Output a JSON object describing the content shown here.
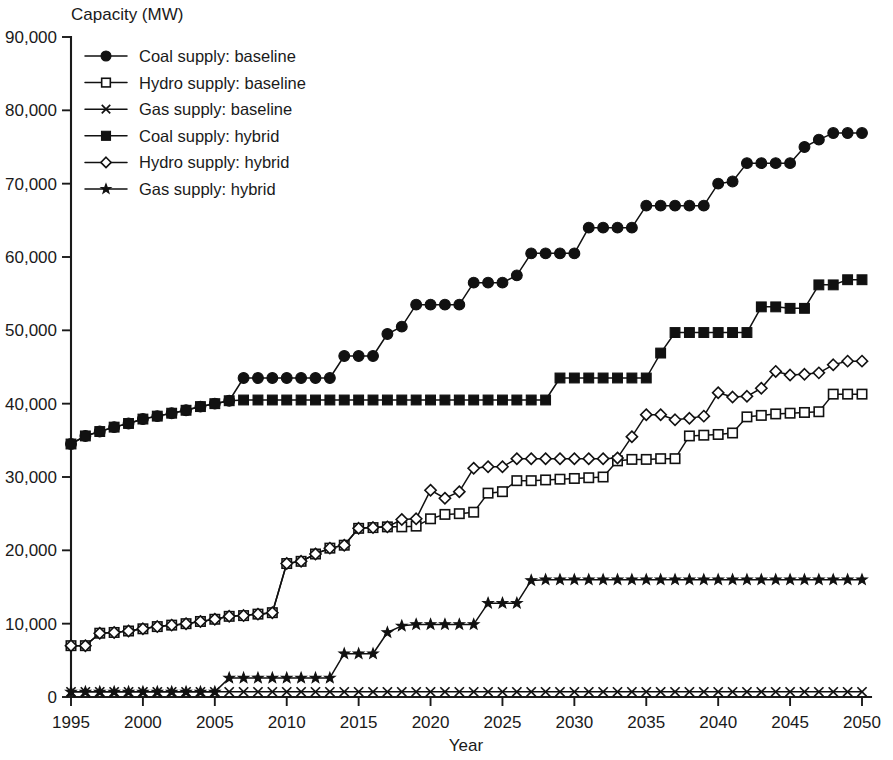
{
  "chart_data": {
    "type": "line",
    "title": "",
    "ylabel": "Capacity (MW)",
    "xlabel": "Year",
    "xlim": [
      1995,
      2050
    ],
    "ylim": [
      0,
      90000
    ],
    "ytick_labels": [
      "0",
      "10,000",
      "20,000",
      "30,000",
      "40,000",
      "50,000",
      "60,000",
      "70,000",
      "80,000",
      "90,000"
    ],
    "ytick_values": [
      0,
      10000,
      20000,
      30000,
      40000,
      50000,
      60000,
      70000,
      80000,
      90000
    ],
    "xtick_labels": [
      "1995",
      "2000",
      "2005",
      "2010",
      "2015",
      "2020",
      "2025",
      "2030",
      "2035",
      "2040",
      "2045",
      "2050"
    ],
    "xtick_values": [
      1995,
      2000,
      2005,
      2010,
      2015,
      2020,
      2025,
      2030,
      2035,
      2040,
      2045,
      2050
    ],
    "grid": false,
    "legend_position": "top-left",
    "x": [
      1995,
      1996,
      1997,
      1998,
      1999,
      2000,
      2001,
      2002,
      2003,
      2004,
      2005,
      2006,
      2007,
      2008,
      2009,
      2010,
      2011,
      2012,
      2013,
      2014,
      2015,
      2016,
      2017,
      2018,
      2019,
      2020,
      2021,
      2022,
      2023,
      2024,
      2025,
      2026,
      2027,
      2028,
      2029,
      2030,
      2031,
      2032,
      2033,
      2034,
      2035,
      2036,
      2037,
      2038,
      2039,
      2040,
      2041,
      2042,
      2043,
      2044,
      2045,
      2046,
      2047,
      2048,
      2049,
      2050
    ],
    "series": [
      {
        "name": "Coal supply: baseline",
        "marker": "filled-circle",
        "values": [
          34500,
          35600,
          36200,
          36800,
          37300,
          37900,
          38300,
          38700,
          39100,
          39600,
          40000,
          40400,
          43500,
          43500,
          43500,
          43500,
          43500,
          43500,
          43500,
          46500,
          46500,
          46500,
          49500,
          50500,
          53500,
          53500,
          53500,
          53500,
          56500,
          56500,
          56500,
          57500,
          60500,
          60500,
          60500,
          60500,
          64000,
          64000,
          64000,
          64000,
          67000,
          67000,
          67000,
          67000,
          67000,
          70000,
          70300,
          72800,
          72800,
          72800,
          72800,
          75000,
          76000,
          76900,
          76900,
          76900
        ]
      },
      {
        "name": "Hydro supply: baseline",
        "marker": "open-square",
        "values": [
          7000,
          7000,
          8700,
          8800,
          9000,
          9300,
          9600,
          9800,
          10000,
          10300,
          10600,
          11000,
          11100,
          11300,
          11500,
          18200,
          18500,
          19500,
          20300,
          20700,
          23000,
          23100,
          23200,
          23200,
          23300,
          24300,
          24900,
          25000,
          25200,
          27800,
          28000,
          29500,
          29500,
          29600,
          29700,
          29800,
          29900,
          30000,
          32200,
          32400,
          32400,
          32500,
          32500,
          35600,
          35700,
          35800,
          36000,
          38200,
          38400,
          38600,
          38700,
          38800,
          38900,
          41300,
          41300,
          41300
        ]
      },
      {
        "name": "Gas supply: baseline",
        "marker": "x-cross",
        "values": [
          700,
          700,
          700,
          700,
          700,
          700,
          700,
          700,
          700,
          700,
          700,
          700,
          700,
          700,
          700,
          700,
          700,
          700,
          700,
          700,
          700,
          700,
          700,
          700,
          700,
          700,
          700,
          700,
          700,
          700,
          700,
          700,
          700,
          700,
          700,
          700,
          700,
          700,
          700,
          700,
          700,
          700,
          700,
          700,
          700,
          700,
          700,
          700,
          700,
          700,
          700,
          700,
          700,
          700,
          700,
          700
        ]
      },
      {
        "name": "Coal supply: hybrid",
        "marker": "filled-square",
        "values": [
          34500,
          35600,
          36200,
          36800,
          37300,
          37900,
          38300,
          38700,
          39100,
          39600,
          40000,
          40400,
          40500,
          40500,
          40500,
          40500,
          40500,
          40500,
          40500,
          40500,
          40500,
          40500,
          40500,
          40500,
          40500,
          40500,
          40500,
          40500,
          40500,
          40500,
          40500,
          40500,
          40500,
          40500,
          43500,
          43500,
          43500,
          43500,
          43500,
          43500,
          43500,
          46900,
          49700,
          49700,
          49700,
          49700,
          49700,
          49700,
          53200,
          53200,
          53000,
          53000,
          56200,
          56200,
          56900,
          56900
        ]
      },
      {
        "name": "Hydro supply: hybrid",
        "marker": "open-diamond",
        "values": [
          7000,
          7000,
          8700,
          8800,
          9000,
          9300,
          9600,
          9800,
          10000,
          10300,
          10600,
          11000,
          11100,
          11300,
          11500,
          18200,
          18500,
          19500,
          20300,
          20700,
          23000,
          23100,
          23200,
          24200,
          24300,
          28200,
          27100,
          28000,
          31200,
          31400,
          31400,
          32500,
          32500,
          32500,
          32500,
          32500,
          32500,
          32500,
          32600,
          35500,
          38500,
          38500,
          37800,
          38000,
          38300,
          41500,
          40900,
          41000,
          42100,
          44400,
          43900,
          44000,
          44200,
          45300,
          45800,
          45800
        ]
      },
      {
        "name": "Gas supply: hybrid",
        "marker": "filled-star",
        "values": [
          700,
          700,
          700,
          700,
          700,
          700,
          700,
          700,
          700,
          700,
          700,
          2600,
          2600,
          2600,
          2600,
          2600,
          2600,
          2600,
          2600,
          5900,
          5900,
          5900,
          8800,
          9700,
          9900,
          9900,
          9900,
          9900,
          9900,
          12800,
          12800,
          12800,
          15900,
          16000,
          16000,
          16000,
          16000,
          16000,
          16000,
          16000,
          16000,
          16000,
          16000,
          16000,
          16000,
          16000,
          16000,
          16000,
          16000,
          16000,
          16000,
          16000,
          16000,
          16000,
          16000,
          16000
        ]
      }
    ]
  },
  "legend": {
    "items": [
      {
        "label": "Coal supply: baseline",
        "marker": "filled-circle"
      },
      {
        "label": "Hydro supply: baseline",
        "marker": "open-square"
      },
      {
        "label": "Gas supply: baseline",
        "marker": "x-cross"
      },
      {
        "label": "Coal supply: hybrid",
        "marker": "filled-square"
      },
      {
        "label": "Hydro supply: hybrid",
        "marker": "open-diamond"
      },
      {
        "label": "Gas supply: hybrid",
        "marker": "filled-star"
      }
    ]
  },
  "colors": {
    "ink": "#111111",
    "background": "#ffffff"
  }
}
